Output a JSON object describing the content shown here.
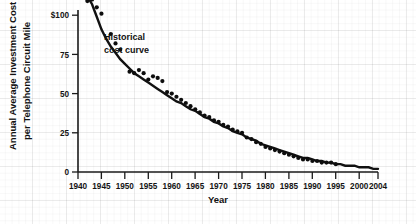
{
  "chart_data": {
    "type": "scatter",
    "title": "",
    "xlabel": "Year",
    "ylabel": "Annual Average Investment Cost per Telephone Circuit Mile",
    "xlim": [
      1940,
      2004
    ],
    "ylim": [
      0,
      112
    ],
    "grid": "faint graph-paper background grid",
    "legend": "none",
    "annotations": [
      {
        "text_line1": "Historical",
        "text_line2": "cost curve",
        "x": 1955,
        "y": 88
      }
    ],
    "y_ticks": [
      {
        "value": 0,
        "label": "0"
      },
      {
        "value": 25,
        "label": "25"
      },
      {
        "value": 50,
        "label": "50"
      },
      {
        "value": 75,
        "label": "75"
      },
      {
        "value": 100,
        "label": "$100"
      }
    ],
    "x_ticks": [
      {
        "value": 1940,
        "label": "1940"
      },
      {
        "value": 1945,
        "label": "1945"
      },
      {
        "value": 1950,
        "label": "1950"
      },
      {
        "value": 1955,
        "label": "1955"
      },
      {
        "value": 1960,
        "label": "1960"
      },
      {
        "value": 1965,
        "label": "1965"
      },
      {
        "value": 1970,
        "label": "1970"
      },
      {
        "value": 1975,
        "label": "1975"
      },
      {
        "value": 1980,
        "label": "1980"
      },
      {
        "value": 1985,
        "label": "1985"
      },
      {
        "value": 1990,
        "label": "1990"
      },
      {
        "value": 1995,
        "label": "1995"
      },
      {
        "value": 2000,
        "label": "2000"
      },
      {
        "value": 2004,
        "label": "2004"
      }
    ],
    "series": [
      {
        "name": "Observed annual average investment cost",
        "marker": "filled circle",
        "color": "#0d0d0d",
        "points": [
          [
            1942,
            109
          ],
          [
            1943,
            110
          ],
          [
            1944,
            105
          ],
          [
            1945,
            101
          ],
          [
            1947,
            88
          ],
          [
            1948,
            82
          ],
          [
            1949,
            78
          ],
          [
            1951,
            64
          ],
          [
            1952,
            63
          ],
          [
            1953,
            65
          ],
          [
            1954,
            63
          ],
          [
            1955,
            59
          ],
          [
            1956,
            61
          ],
          [
            1957,
            60
          ],
          [
            1958,
            58
          ],
          [
            1959,
            51
          ],
          [
            1960,
            50
          ],
          [
            1961,
            48
          ],
          [
            1962,
            46
          ],
          [
            1963,
            44
          ],
          [
            1964,
            42
          ],
          [
            1965,
            40
          ],
          [
            1966,
            38
          ],
          [
            1967,
            36
          ],
          [
            1968,
            35
          ],
          [
            1969,
            33
          ],
          [
            1970,
            32
          ],
          [
            1971,
            30
          ],
          [
            1972,
            29
          ],
          [
            1973,
            27
          ],
          [
            1974,
            26
          ],
          [
            1975,
            25
          ],
          [
            1976,
            22
          ],
          [
            1977,
            21
          ],
          [
            1978,
            19
          ],
          [
            1979,
            18
          ],
          [
            1980,
            16
          ],
          [
            1981,
            15
          ],
          [
            1982,
            14
          ],
          [
            1983,
            13
          ],
          [
            1984,
            12
          ],
          [
            1985,
            11
          ],
          [
            1986,
            10
          ],
          [
            1987,
            9
          ],
          [
            1988,
            8
          ],
          [
            1989,
            8
          ],
          [
            1990,
            7
          ],
          [
            1991,
            7
          ],
          [
            1992,
            6
          ],
          [
            1993,
            6
          ],
          [
            1994,
            6
          ],
          [
            1995,
            5
          ]
        ]
      },
      {
        "name": "Historical cost curve (fitted)",
        "marker": "none",
        "color": "#111111",
        "points": [
          [
            1942,
            112
          ],
          [
            1943,
            107
          ],
          [
            1944,
            99
          ],
          [
            1945,
            91
          ],
          [
            1946,
            85
          ],
          [
            1947,
            80
          ],
          [
            1948,
            76
          ],
          [
            1949,
            72
          ],
          [
            1950,
            69
          ],
          [
            1951,
            66
          ],
          [
            1952,
            63
          ],
          [
            1953,
            61
          ],
          [
            1954,
            59
          ],
          [
            1955,
            57
          ],
          [
            1956,
            55
          ],
          [
            1957,
            53
          ],
          [
            1958,
            51
          ],
          [
            1959,
            49
          ],
          [
            1960,
            47
          ],
          [
            1961,
            45
          ],
          [
            1962,
            44
          ],
          [
            1963,
            42
          ],
          [
            1964,
            40
          ],
          [
            1965,
            39
          ],
          [
            1966,
            37
          ],
          [
            1967,
            35
          ],
          [
            1968,
            34
          ],
          [
            1969,
            32
          ],
          [
            1970,
            31
          ],
          [
            1971,
            29
          ],
          [
            1972,
            28
          ],
          [
            1973,
            26
          ],
          [
            1974,
            25
          ],
          [
            1975,
            24
          ],
          [
            1976,
            22
          ],
          [
            1977,
            21
          ],
          [
            1978,
            20
          ],
          [
            1979,
            18
          ],
          [
            1980,
            17
          ],
          [
            1981,
            16
          ],
          [
            1982,
            15
          ],
          [
            1983,
            14
          ],
          [
            1984,
            13
          ],
          [
            1985,
            12
          ],
          [
            1986,
            11
          ],
          [
            1987,
            10
          ],
          [
            1988,
            9
          ],
          [
            1989,
            9
          ],
          [
            1990,
            8
          ],
          [
            1991,
            7
          ],
          [
            1992,
            7
          ],
          [
            1993,
            6
          ],
          [
            1994,
            6
          ],
          [
            1995,
            5
          ],
          [
            1996,
            5
          ],
          [
            1997,
            4
          ],
          [
            1998,
            4
          ],
          [
            1999,
            4
          ],
          [
            2000,
            3
          ],
          [
            2001,
            3
          ],
          [
            2002,
            3
          ],
          [
            2003,
            2
          ],
          [
            2004,
            2
          ]
        ]
      }
    ]
  },
  "source_note": "SOURCE: AT&T. Recent figures are authors' estimates."
}
